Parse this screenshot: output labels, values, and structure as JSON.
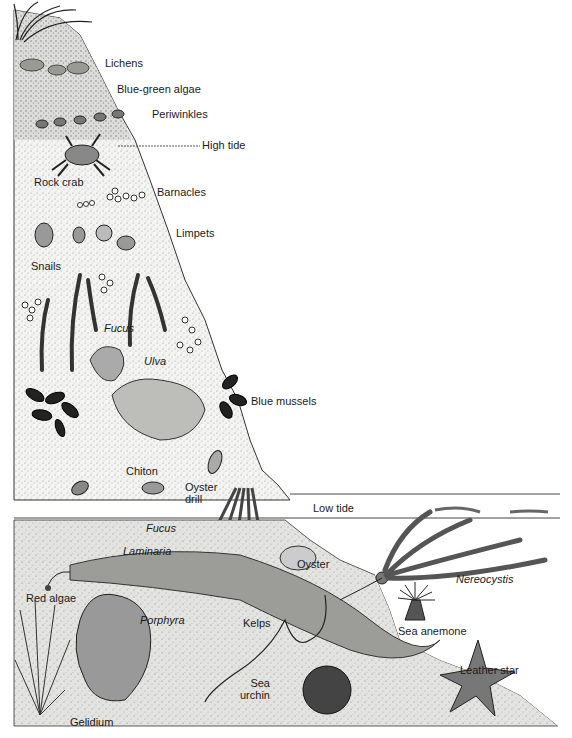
{
  "diagram": {
    "type": "intertidal-zonation-illustration",
    "zones": {
      "high_tide": {
        "label": "High tide",
        "y": 146
      },
      "low_tide": {
        "label": "Low tide",
        "y": 507
      }
    },
    "labels": [
      {
        "id": "lichens",
        "text": "Lichens",
        "x": 105,
        "y": 57,
        "italic": false
      },
      {
        "id": "blue-green-algae",
        "text": "Blue-green algae",
        "x": 117,
        "y": 83,
        "italic": false
      },
      {
        "id": "periwinkles",
        "text": "Periwinkles",
        "x": 152,
        "y": 108,
        "italic": false
      },
      {
        "id": "high-tide",
        "text": "High tide",
        "x": 202,
        "y": 139,
        "italic": false
      },
      {
        "id": "rock-crab",
        "text": "Rock crab",
        "x": 34,
        "y": 176,
        "italic": false
      },
      {
        "id": "barnacles",
        "text": "Barnacles",
        "x": 157,
        "y": 186,
        "italic": false
      },
      {
        "id": "limpets",
        "text": "Limpets",
        "x": 176,
        "y": 227,
        "italic": false
      },
      {
        "id": "snails",
        "text": "Snails",
        "x": 31,
        "y": 260,
        "italic": false
      },
      {
        "id": "fucus-upper",
        "text": "Fucus",
        "x": 104,
        "y": 322,
        "italic": true
      },
      {
        "id": "ulva",
        "text": "Ulva",
        "x": 144,
        "y": 355,
        "italic": true
      },
      {
        "id": "blue-mussels",
        "text": "Blue mussels",
        "x": 251,
        "y": 395,
        "italic": false
      },
      {
        "id": "chiton",
        "text": "Chiton",
        "x": 126,
        "y": 465,
        "italic": false
      },
      {
        "id": "oyster-drill",
        "text": "Oyster\ndrill",
        "x": 185,
        "y": 481,
        "italic": false
      },
      {
        "id": "low-tide",
        "text": "Low tide",
        "x": 313,
        "y": 502,
        "italic": false
      },
      {
        "id": "fucus-lower",
        "text": "Fucus",
        "x": 146,
        "y": 522,
        "italic": true
      },
      {
        "id": "laminaria",
        "text": "Laminaria",
        "x": 123,
        "y": 545,
        "italic": true
      },
      {
        "id": "oyster",
        "text": "Oyster",
        "x": 297,
        "y": 558,
        "italic": false
      },
      {
        "id": "nereocystis",
        "text": "Nereocystis",
        "x": 456,
        "y": 573,
        "italic": true
      },
      {
        "id": "red-algae",
        "text": "Red algae",
        "x": 26,
        "y": 592,
        "italic": false
      },
      {
        "id": "porphyra",
        "text": "Porphyra",
        "x": 140,
        "y": 614,
        "italic": true
      },
      {
        "id": "kelps",
        "text": "Kelps",
        "x": 243,
        "y": 617,
        "italic": false
      },
      {
        "id": "sea-anemone",
        "text": "Sea anemone",
        "x": 398,
        "y": 625,
        "italic": false
      },
      {
        "id": "leather-star",
        "text": "Leather star",
        "x": 460,
        "y": 664,
        "italic": false
      },
      {
        "id": "sea-urchin",
        "text": "Sea\nurchin",
        "x": 240,
        "y": 677,
        "italic": false
      },
      {
        "id": "gelidium",
        "text": "Gelidium",
        "x": 70,
        "y": 716,
        "italic": false
      }
    ]
  }
}
